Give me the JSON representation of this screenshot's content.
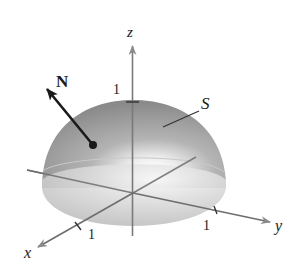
{
  "figure": {
    "surface_label": "S",
    "normal_label": "N",
    "axes": {
      "x_label": "x",
      "y_label": "y",
      "z_label": "z"
    },
    "ticks": {
      "x_tick": "1",
      "y_tick": "1",
      "z_tick": "1"
    },
    "colors": {
      "surface_dark": "#8f8f8f",
      "surface_light": "#f2f2f2",
      "base_disk": "#cfcfcf",
      "axis": "#6e6e6e",
      "arrow": "#1a1a1a",
      "text": "#1a1a1a"
    }
  }
}
